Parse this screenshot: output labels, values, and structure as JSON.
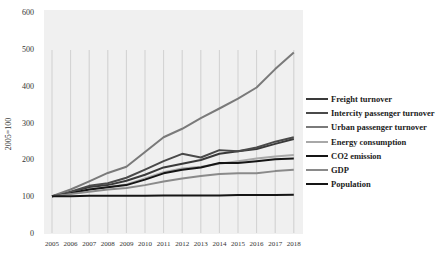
{
  "chart_data": {
    "type": "line",
    "title": "",
    "xlabel": "",
    "ylabel": "2005=100",
    "ylim": [
      0,
      600
    ],
    "yticks": [
      "0",
      "100",
      "200",
      "300",
      "400",
      "500",
      "600"
    ],
    "grid": "vertical",
    "legend_position": "right",
    "x": [
      "2005",
      "2006",
      "2007",
      "2008",
      "2009",
      "2010",
      "2011",
      "2012",
      "2013",
      "2014",
      "2015",
      "2016",
      "2017",
      "2018"
    ],
    "series": [
      {
        "name": "Freight turnover",
        "color": "#3a3a3a",
        "values": [
          100,
          110,
          125,
          130,
          142,
          158,
          178,
          188,
          198,
          215,
          222,
          228,
          242,
          255
        ]
      },
      {
        "name": "Intercity passenger turnover",
        "color": "#4a4a4a",
        "values": [
          100,
          112,
          128,
          135,
          150,
          172,
          195,
          215,
          205,
          225,
          222,
          232,
          248,
          260
        ]
      },
      {
        "name": "Urban passenger turnover",
        "color": "#7a7a7a",
        "values": [
          100,
          118,
          140,
          163,
          180,
          220,
          260,
          283,
          312,
          338,
          365,
          395,
          445,
          490
        ]
      },
      {
        "name": "Energy consumption",
        "color": "#a8a8a8",
        "values": [
          100,
          108,
          118,
          125,
          132,
          148,
          165,
          175,
          180,
          188,
          195,
          202,
          208,
          212
        ]
      },
      {
        "name": "CO2 emission",
        "color": "#151515",
        "values": [
          100,
          108,
          118,
          124,
          130,
          145,
          162,
          172,
          178,
          190,
          190,
          195,
          200,
          202
        ]
      },
      {
        "name": "GDP",
        "color": "#8a8a8a",
        "values": [
          100,
          106,
          112,
          118,
          122,
          130,
          140,
          148,
          155,
          160,
          162,
          162,
          168,
          172
        ]
      },
      {
        "name": "Population",
        "color": "#151515",
        "values": [
          100,
          100,
          101,
          101,
          101,
          101,
          102,
          102,
          102,
          102,
          103,
          103,
          103,
          104
        ]
      }
    ]
  }
}
